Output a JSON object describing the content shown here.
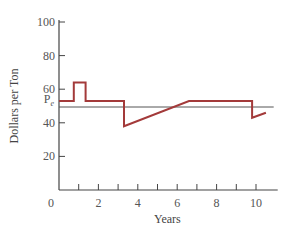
{
  "chart_data": {
    "type": "line",
    "title": "",
    "xlabel": "Years",
    "ylabel": "Dollars per Ton",
    "xlim": [
      0,
      11
    ],
    "ylim": [
      0,
      100
    ],
    "x_ticks": [
      1,
      2,
      3,
      4,
      5,
      6,
      7,
      8,
      9,
      10
    ],
    "x_tick_labels": [
      {
        "value": 0,
        "label": "0"
      },
      {
        "value": 2,
        "label": "2"
      },
      {
        "value": 4,
        "label": "4"
      },
      {
        "value": 6,
        "label": "6"
      },
      {
        "value": 8,
        "label": "8"
      },
      {
        "value": 10,
        "label": "10"
      }
    ],
    "y_tick_labels": [
      {
        "value": 20,
        "label": "20"
      },
      {
        "value": 40,
        "label": "40"
      },
      {
        "value": 60,
        "label": "60"
      },
      {
        "value": 80,
        "label": "80"
      },
      {
        "value": 100,
        "label": "100"
      }
    ],
    "grid": false,
    "reference_line": {
      "label": "P",
      "subscript": "e",
      "value": 50
    },
    "series": [
      {
        "name": "price",
        "color": "#a33a3a",
        "points": [
          [
            0,
            53
          ],
          [
            0.75,
            53
          ],
          [
            0.75,
            64
          ],
          [
            1.35,
            64
          ],
          [
            1.35,
            53
          ],
          [
            3.3,
            53
          ],
          [
            3.3,
            38
          ],
          [
            6.6,
            53
          ],
          [
            9.8,
            53
          ],
          [
            9.8,
            43
          ],
          [
            10.5,
            46
          ]
        ]
      }
    ]
  }
}
